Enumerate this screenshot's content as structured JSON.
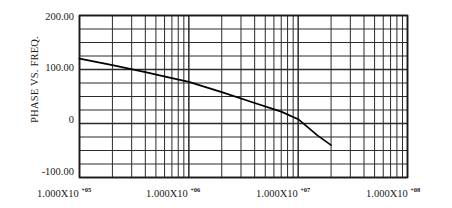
{
  "figure": {
    "background_color": "#ffffff",
    "ink_color": "#1a1a1a",
    "grid_color": "#2b2b2b",
    "curve_color": "#000000"
  },
  "axes": {
    "y_axis_title": "PHASE VS. FREQ.",
    "y_tick_labels": [
      "200.00",
      "100.00",
      "0",
      "-100.00"
    ],
    "y_tick_values": [
      200,
      100,
      0,
      -100
    ],
    "x_tick_labels": [
      {
        "mantissa": "1.000X10",
        "exponent": "+05"
      },
      {
        "mantissa": "1.000X10",
        "exponent": "+06"
      },
      {
        "mantissa": "1.000X10",
        "exponent": "+07"
      },
      {
        "mantissa": "1.000X10",
        "exponent": "+08"
      }
    ]
  },
  "chart_data": {
    "type": "line",
    "title": "",
    "xlabel": "",
    "ylabel": "PHASE VS. FREQ.",
    "xscale": "log",
    "yscale": "linear",
    "xlim": [
      100000,
      100000000
    ],
    "ylim": [
      -100,
      200
    ],
    "grid": true,
    "grid_style": "log-minor-vertical-and-linear-horizontal",
    "y_major_ticks": [
      200,
      100,
      0,
      -100
    ],
    "y_minor_step": 25,
    "legend": "none",
    "series": [
      {
        "name": "Phase",
        "x": [
          100000,
          200000,
          400000,
          700000,
          1000000,
          2000000,
          4000000,
          7000000,
          10000000,
          15000000,
          20000000
        ],
        "y": [
          120,
          108,
          95,
          84,
          77,
          58,
          38,
          22,
          8,
          -22,
          -40
        ]
      }
    ]
  }
}
